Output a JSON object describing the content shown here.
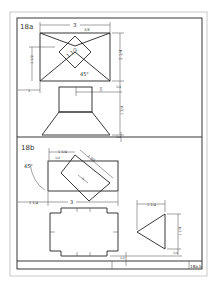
{
  "sheet": {
    "title_block": {
      "sheet_label": "18a,b"
    }
  },
  "problem_a": {
    "label": "18a",
    "dims": {
      "width": "3",
      "small_top": "3/8",
      "left_height": "1 1/2",
      "right_height": "2 1/4",
      "diameter": "1 1/2",
      "angle": "45°",
      "offset_left": "1",
      "gap": "1/4",
      "front_height": "1 3/4",
      "bottom": "1/4",
      "front_small": "1/4"
    }
  },
  "problem_b": {
    "label": "18b",
    "dims": {
      "top_offset": "1 1/4",
      "depth": "1/4",
      "diag": "1 3/4",
      "inner": "1",
      "angle": "45°",
      "left_offset": "1 1/4",
      "width": "3",
      "tri_width": "1 1/4",
      "tri_height": "1 1/4",
      "tri_bottom": "1/4",
      "bottom_gap": "1/2"
    }
  }
}
